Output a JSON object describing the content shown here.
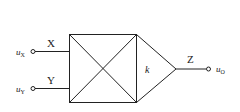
{
  "diagram": {
    "type": "analog multiplier symbol",
    "inputs": [
      {
        "port": "X",
        "signal": "u",
        "subscript": "X"
      },
      {
        "port": "Y",
        "signal": "u",
        "subscript": "Y"
      }
    ],
    "gain_label": "k",
    "output": {
      "port": "Z",
      "signal": "u",
      "subscript": "O"
    },
    "colors": {
      "stroke": "#222222",
      "background": "#ffffff"
    }
  }
}
